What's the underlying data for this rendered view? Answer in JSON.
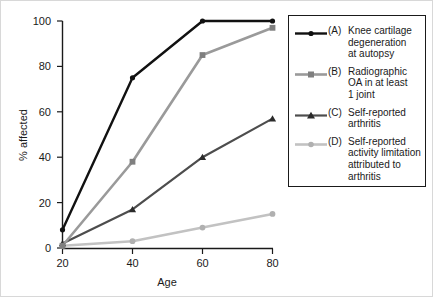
{
  "chart_data": {
    "type": "line",
    "title": "",
    "xlabel": "Age",
    "ylabel": "% affected",
    "x": [
      20,
      40,
      60,
      80
    ],
    "xlim": [
      20,
      80
    ],
    "ylim": [
      0,
      100
    ],
    "xticks": [
      "20",
      "40",
      "60",
      "80"
    ],
    "yticks": [
      "0",
      "20",
      "40",
      "60",
      "80",
      "100"
    ],
    "grid": false,
    "legend_position": "right",
    "series": [
      {
        "key": "(A)",
        "name": "Knee cartilage degeneration at autopsy",
        "values": [
          8,
          75,
          100,
          100
        ],
        "color": "#111111",
        "marker": "circle"
      },
      {
        "key": "(B)",
        "name": "Radiographic OA in at least 1 joint",
        "values": [
          1,
          38,
          85,
          97
        ],
        "color": "#9a9a9a",
        "marker": "square"
      },
      {
        "key": "(C)",
        "name": "Self-reported arthritis",
        "values": [
          2,
          17,
          40,
          57
        ],
        "color": "#4d4d4d",
        "marker": "triangle"
      },
      {
        "key": "(D)",
        "name": "Self-reported activity limitation attributed to arthritis",
        "values": [
          1,
          3,
          9,
          15
        ],
        "color": "#c2c2c2",
        "marker": "circle"
      }
    ]
  },
  "legend": {
    "entries": [
      {
        "key": "(A)",
        "line1": "Knee cartilage",
        "line2": "degeneration",
        "line3": "at autopsy"
      },
      {
        "key": "(B)",
        "line1": "Radiographic",
        "line2": "OA in at least",
        "line3": "1 joint"
      },
      {
        "key": "(C)",
        "line1": "Self-reported",
        "line2": "arthritis",
        "line3": ""
      },
      {
        "key": "(D)",
        "line1": "Self-reported",
        "line2": "activity limitation",
        "line3": "attributed to",
        "line4": "arthritis"
      }
    ]
  }
}
